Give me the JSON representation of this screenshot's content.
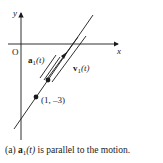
{
  "diagram": {
    "axes": {
      "x_label": "x",
      "y_label": "y",
      "origin_label": "O"
    },
    "vectors": [
      {
        "name": "a",
        "subscript": "1",
        "arg": "(t)",
        "label": "a1(t)"
      },
      {
        "name": "v",
        "subscript": "1",
        "arg": "(t)",
        "label": "v1(t)"
      }
    ],
    "points": [
      {
        "label": "(1, –3)"
      }
    ],
    "caption": {
      "prefix": "(a) ",
      "vec_name": "a",
      "vec_sub": "1",
      "vec_arg": "(t)",
      "suffix": " is parallel to the motion."
    },
    "colors": {
      "ink": "#1a1a1a",
      "background": "#ffffff"
    }
  }
}
